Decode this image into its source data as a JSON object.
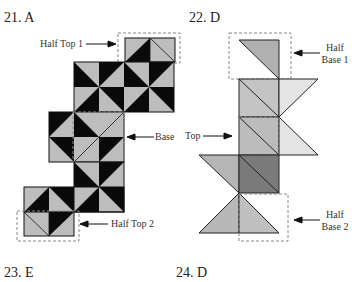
{
  "answers": [
    {
      "number": "21.",
      "letter": "A",
      "text": "21. A"
    },
    {
      "number": "22.",
      "letter": "D",
      "text": "22. D"
    },
    {
      "number": "23.",
      "letter": "E",
      "text": "23. E"
    },
    {
      "number": "24.",
      "letter": "D",
      "text": "24. D"
    }
  ],
  "figure_21": {
    "labels": {
      "half_top_1": "Half Top 1",
      "base": "Base",
      "half_top_2": "Half Top 2"
    },
    "colors": {
      "dark": "#0a0a0a",
      "light": "#bdbdbd",
      "outline": "#111111",
      "dashed": "#888888"
    }
  },
  "figure_22": {
    "labels": {
      "half_base_1_line1": "Half",
      "half_base_1_line2": "Base 1",
      "top": "Top",
      "half_base_2_line1": "Half",
      "half_base_2_line2": "Base 2"
    },
    "colors": {
      "mid_gray": "#b0b0b0",
      "light_gray": "#dcdcdc",
      "dark_gray": "#777777",
      "pale": "#e6e6e6",
      "outline": "#222222",
      "dashed": "#888888"
    }
  }
}
